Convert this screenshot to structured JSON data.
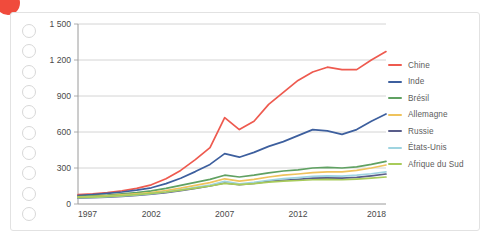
{
  "decoration": {
    "corner_dot_color": "#f04b3c",
    "binding_hole_count": 10,
    "binding_hole_color": "#d8d8d8",
    "card_border_color": "#e2e2e2"
  },
  "legend": {
    "position": "right",
    "items": [
      {
        "label": "Chine",
        "color": "#ee5a4f"
      },
      {
        "label": "Inde",
        "color": "#3d5f9e"
      },
      {
        "label": "Brésil",
        "color": "#60a162"
      },
      {
        "label": "Allemagne",
        "color": "#efc35c"
      },
      {
        "label": "Russie",
        "color": "#595d8a"
      },
      {
        "label": "États-Unis",
        "color": "#9fd4e0"
      },
      {
        "label": "Afrique du Sud",
        "color": "#a8cb5a"
      }
    ]
  },
  "chart_data": {
    "type": "line",
    "title": "",
    "subtitle": "",
    "xlabel": "",
    "ylabel": "",
    "xlim": [
      1997,
      2018
    ],
    "ylim": [
      0,
      1500
    ],
    "grid": true,
    "y_ticks": [
      0,
      300,
      600,
      900,
      1200,
      1500
    ],
    "y_tick_labels": [
      "0",
      "300",
      "600",
      "900",
      "1 200",
      "1 500"
    ],
    "x_ticks": [
      1997,
      2002,
      2007,
      2012,
      2018
    ],
    "x_tick_labels": [
      "1997",
      "2002",
      "2007",
      "2012",
      "2018"
    ],
    "x": [
      1997,
      1998,
      1999,
      2000,
      2001,
      2002,
      2003,
      2004,
      2005,
      2006,
      2007,
      2008,
      2009,
      2010,
      2011,
      2012,
      2013,
      2014,
      2015,
      2016,
      2017,
      2018
    ],
    "series": [
      {
        "name": "Chine",
        "color": "#ee5a4f",
        "values": [
          78,
          85,
          95,
          110,
          130,
          160,
          210,
          280,
          370,
          470,
          720,
          620,
          690,
          830,
          930,
          1030,
          1100,
          1140,
          1120,
          1120,
          1200,
          1270
        ]
      },
      {
        "name": "Inde",
        "color": "#3d5f9e",
        "values": [
          70,
          78,
          88,
          100,
          115,
          135,
          170,
          215,
          270,
          330,
          420,
          390,
          430,
          480,
          520,
          570,
          620,
          610,
          580,
          620,
          690,
          750
        ]
      },
      {
        "name": "Brésil",
        "color": "#60a162",
        "values": [
          62,
          68,
          75,
          85,
          95,
          110,
          130,
          155,
          180,
          205,
          240,
          225,
          240,
          260,
          275,
          285,
          300,
          305,
          300,
          310,
          330,
          355
        ]
      },
      {
        "name": "Allemagne",
        "color": "#efc35c",
        "values": [
          58,
          62,
          68,
          76,
          85,
          96,
          112,
          132,
          155,
          178,
          210,
          190,
          205,
          225,
          240,
          250,
          262,
          268,
          268,
          280,
          300,
          325
        ]
      },
      {
        "name": "Russie",
        "color": "#595d8a",
        "values": [
          48,
          52,
          57,
          64,
          72,
          82,
          95,
          112,
          130,
          150,
          175,
          162,
          172,
          188,
          198,
          206,
          215,
          218,
          215,
          222,
          235,
          250
        ]
      },
      {
        "name": "États-Unis",
        "color": "#9fd4e0",
        "values": [
          52,
          56,
          61,
          68,
          76,
          86,
          100,
          118,
          138,
          158,
          188,
          168,
          180,
          198,
          212,
          220,
          230,
          235,
          232,
          240,
          252,
          268
        ]
      },
      {
        "name": "Afrique du Sud",
        "color": "#a8cb5a",
        "values": [
          55,
          58,
          63,
          70,
          78,
          88,
          100,
          115,
          132,
          150,
          172,
          162,
          170,
          182,
          190,
          196,
          202,
          205,
          202,
          208,
          216,
          225
        ]
      }
    ]
  }
}
